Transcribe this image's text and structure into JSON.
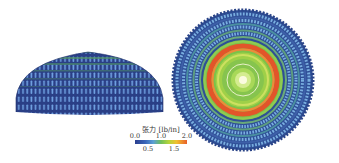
{
  "figure": {
    "left_panel": {
      "description": "side view of inflated dome membrane, tension field"
    },
    "right_panel": {
      "description": "top view of dome membrane, concentric tension rings"
    }
  },
  "colorbar": {
    "title": "张力 [lb/in]",
    "top_ticks": [
      "0.0",
      "1.0",
      "2.0"
    ],
    "bottom_ticks": [
      "0.5",
      "1.5"
    ],
    "range": [
      0.0,
      2.0
    ],
    "colors": [
      "#2b3f8f",
      "#3a66b8",
      "#5a9fd6",
      "#6fbf5a",
      "#b5d43a",
      "#f0c030",
      "#e8602a"
    ]
  },
  "colors": {
    "dome_dark": "#2a3f86",
    "dome_light": "#6f9fe0",
    "dome_green": "#4f8f6a",
    "disk_outer": "#3d5fa8",
    "disk_blue_light": "#79aee0",
    "disk_green": "#7cc24a",
    "disk_red": "#e2552a",
    "disk_yellow": "#d8e060",
    "disk_center": "#fbfbe0"
  }
}
